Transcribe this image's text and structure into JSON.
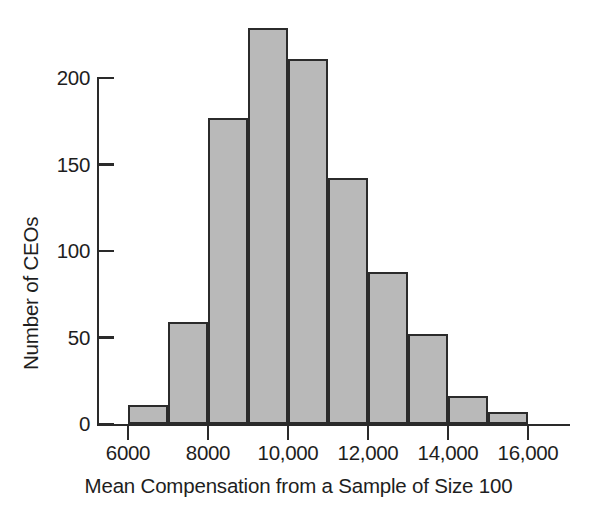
{
  "chart_data": {
    "type": "bar",
    "title": "",
    "subtitle": "",
    "xlabel": "Mean Compensation from a Sample of Size 100",
    "ylabel": "Number of CEOs",
    "xlim": [
      6000,
      17000
    ],
    "ylim": [
      0,
      230
    ],
    "grid": false,
    "legend": null,
    "bin_width": 1000,
    "bin_edges": [
      6000,
      7000,
      8000,
      9000,
      10000,
      11000,
      12000,
      13000,
      14000,
      15000,
      16000
    ],
    "categories": [
      "6000-7000",
      "7000-8000",
      "8000-9000",
      "9000-10,000",
      "10,000-11,000",
      "11,000-12,000",
      "12,000-13,000",
      "13,000-14,000",
      "14,000-15,000",
      "15,000-16,000"
    ],
    "values": [
      11,
      59,
      177,
      229,
      211,
      142,
      88,
      52,
      16,
      7
    ],
    "x_ticks": [
      {
        "value": 6000,
        "label": "6000"
      },
      {
        "value": 8000,
        "label": "8000"
      },
      {
        "value": 10000,
        "label": "10,000"
      },
      {
        "value": 12000,
        "label": "12,000"
      },
      {
        "value": 14000,
        "label": "14,000"
      },
      {
        "value": 16000,
        "label": "16,000"
      }
    ],
    "y_ticks": [
      {
        "value": 0,
        "label": "0"
      },
      {
        "value": 50,
        "label": "50"
      },
      {
        "value": 100,
        "label": "100"
      },
      {
        "value": 150,
        "label": "150"
      },
      {
        "value": 200,
        "label": "200"
      }
    ],
    "colors": {
      "bar_fill": "#b9b9b9",
      "bar_stroke": "#2b2b2b",
      "axis": "#2a2a2a",
      "text": "#1e1e1e",
      "background": "#ffffff"
    }
  }
}
